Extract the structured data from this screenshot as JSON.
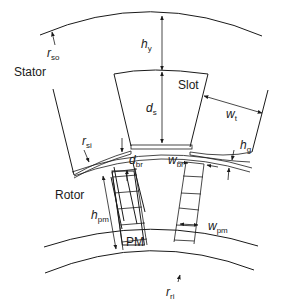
{
  "diagram": {
    "regions": {
      "stator": "Stator",
      "rotor": "Rotor",
      "slot": "Slot",
      "magnet": "PM"
    },
    "dimensions": {
      "r_so": {
        "sym": "r",
        "sub": "so"
      },
      "r_si": {
        "sym": "r",
        "sub": "si"
      },
      "r_ri": {
        "sym": "r",
        "sub": "ri"
      },
      "h_y": {
        "sym": "h",
        "sub": "y"
      },
      "d_s": {
        "sym": "d",
        "sub": "s"
      },
      "w_t": {
        "sym": "w",
        "sub": "t"
      },
      "h_g": {
        "sym": "h",
        "sub": "g"
      },
      "d_br": {
        "sym": "d",
        "sub": "br"
      },
      "w_br": {
        "sym": "w",
        "sub": "br"
      },
      "h_pm": {
        "sym": "h",
        "sub": "pm"
      },
      "w_pm": {
        "sym": "w",
        "sub": "pm"
      }
    },
    "colors": {
      "line": "#1a1a1a",
      "background": "#ffffff"
    }
  }
}
